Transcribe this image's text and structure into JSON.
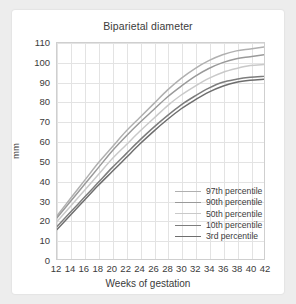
{
  "chart_data": {
    "type": "line",
    "title": "Biparietal diameter",
    "xlabel": "Weeks of gestation",
    "ylabel": "mm",
    "xlim": [
      12,
      42
    ],
    "ylim": [
      0,
      110
    ],
    "grid": true,
    "legend_position": "inside-lower-right",
    "x": [
      12,
      14,
      16,
      18,
      20,
      22,
      24,
      26,
      28,
      30,
      32,
      34,
      36,
      38,
      40,
      42
    ],
    "xticks": [
      "12",
      "14",
      "16",
      "18",
      "20",
      "22",
      "24",
      "26",
      "28",
      "30",
      "32",
      "34",
      "36",
      "38",
      "40",
      "42"
    ],
    "yticks": [
      "0",
      "10",
      "20",
      "30",
      "40",
      "50",
      "60",
      "70",
      "80",
      "90",
      "100",
      "110"
    ],
    "series": [
      {
        "name": "97th percentile",
        "color": "#b0b0b0",
        "values": [
          22,
          31,
          40,
          49,
          57,
          65,
          72,
          79,
          86,
          92,
          97,
          101,
          104,
          106,
          107,
          108
        ]
      },
      {
        "name": "90th percentile",
        "color": "#9a9a9a",
        "values": [
          21,
          29.5,
          38,
          46.5,
          55,
          62.5,
          69.5,
          76,
          82.5,
          88,
          93,
          97,
          100,
          102,
          103,
          104
        ]
      },
      {
        "name": "50th percentile",
        "color": "#c9c9c9",
        "values": [
          19,
          27,
          35,
          43,
          51,
          58,
          65,
          71.5,
          78,
          83.5,
          88,
          92,
          95,
          97,
          98.5,
          99
        ]
      },
      {
        "name": "10th percentile",
        "color": "#7d7d7d",
        "values": [
          16.5,
          24,
          31.5,
          39,
          46.5,
          53.5,
          60.5,
          67,
          73,
          78.5,
          83,
          87,
          90,
          91.5,
          92.5,
          93
        ]
      },
      {
        "name": "3rd percentile",
        "color": "#6e6e6e",
        "values": [
          15,
          22.5,
          30,
          37.5,
          44.5,
          51.5,
          58.5,
          65,
          71,
          76.5,
          81,
          85,
          88,
          90,
          91,
          91.5
        ]
      }
    ]
  }
}
